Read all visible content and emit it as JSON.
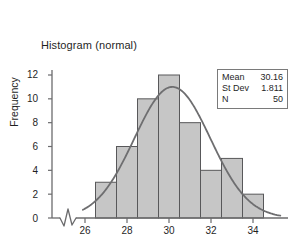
{
  "chart_data": {
    "type": "bar",
    "title": "Histogram (normal)",
    "xlabel": "",
    "ylabel": "Frequency",
    "categories": [
      27,
      28,
      29,
      30,
      31,
      32,
      33,
      34
    ],
    "bin_edges": [
      26.5,
      27.5,
      28.5,
      29.5,
      30.5,
      31.5,
      32.5,
      33.5,
      34.5
    ],
    "values": [
      3,
      6,
      10,
      12,
      8,
      4,
      5,
      2
    ],
    "xlim": [
      25.2,
      35.4
    ],
    "ylim": [
      0,
      12.6
    ],
    "y_ticks": [
      0,
      2,
      4,
      6,
      8,
      10,
      12
    ],
    "x_ticks": [
      26,
      28,
      30,
      32,
      34
    ],
    "grid": false,
    "legend_position": "top-right",
    "axis_break": true,
    "overlay": {
      "type": "line",
      "name": "normal curve",
      "mean": 30.16,
      "st_dev": 1.811,
      "n": 50,
      "peak_value": 11.0
    },
    "colors": {
      "bar_fill": "#c6c6c6",
      "bar_edge": "#58585a",
      "curve": "#6e6e70",
      "axis": "#6b6b6d",
      "text": "#1f1f1f",
      "box_border": "#7a7a7a"
    }
  },
  "stats_box": {
    "rows": [
      {
        "label": "Mean",
        "value": "30.16"
      },
      {
        "label": "St Dev",
        "value": "1.811"
      },
      {
        "label": "N",
        "value": "50"
      }
    ]
  },
  "y_tick_labels": [
    "12",
    "10",
    "8",
    "6",
    "4",
    "2",
    "0"
  ],
  "x_tick_labels": [
    "26",
    "28",
    "30",
    "32",
    "34"
  ]
}
